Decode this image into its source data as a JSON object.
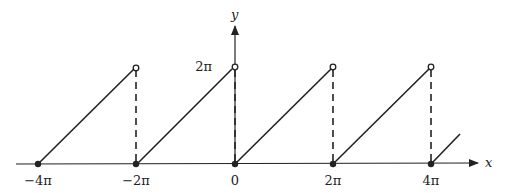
{
  "figure": {
    "type": "sawtooth-function-graph",
    "axes": {
      "x_label": "x",
      "y_label": "y",
      "y_tick_label": "2π",
      "x_tick_labels": [
        "−4π",
        "−2π",
        "0",
        "2π",
        "4π"
      ]
    },
    "segments": [
      {
        "from": "−4π",
        "to": "−2π",
        "start_y": "0",
        "end_y": "2π",
        "start": "closed",
        "end": "open"
      },
      {
        "from": "−2π",
        "to": "0",
        "start_y": "0",
        "end_y": "2π",
        "start": "closed",
        "end": "open"
      },
      {
        "from": "0",
        "to": "2π",
        "start_y": "0",
        "end_y": "2π",
        "start": "closed",
        "end": "open"
      },
      {
        "from": "2π",
        "to": "4π",
        "start_y": "0",
        "end_y": "2π",
        "start": "closed",
        "end": "open"
      },
      {
        "from": "4π",
        "to": "…",
        "start_y": "0",
        "end_y": "partial",
        "start": "closed",
        "end": "continues"
      }
    ],
    "colors": {
      "ink": "#222222",
      "background": "#ffffff"
    }
  }
}
